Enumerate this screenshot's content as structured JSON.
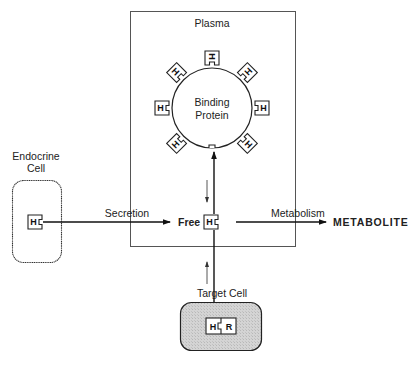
{
  "diagram": {
    "compartments": {
      "plasma": "Plasma",
      "binding_protein": [
        "Binding",
        "Protein"
      ],
      "endocrine_cell": [
        "Endocrine",
        "Cell"
      ],
      "target_cell": "Target Cell"
    },
    "hormone_symbol": "H",
    "receptor_symbol": "R",
    "labels": {
      "secretion": "Secretion",
      "free": "Free",
      "metabolism": "Metabolism",
      "metabolite": "METABOLITE"
    },
    "bound_hormone_count": 7
  }
}
